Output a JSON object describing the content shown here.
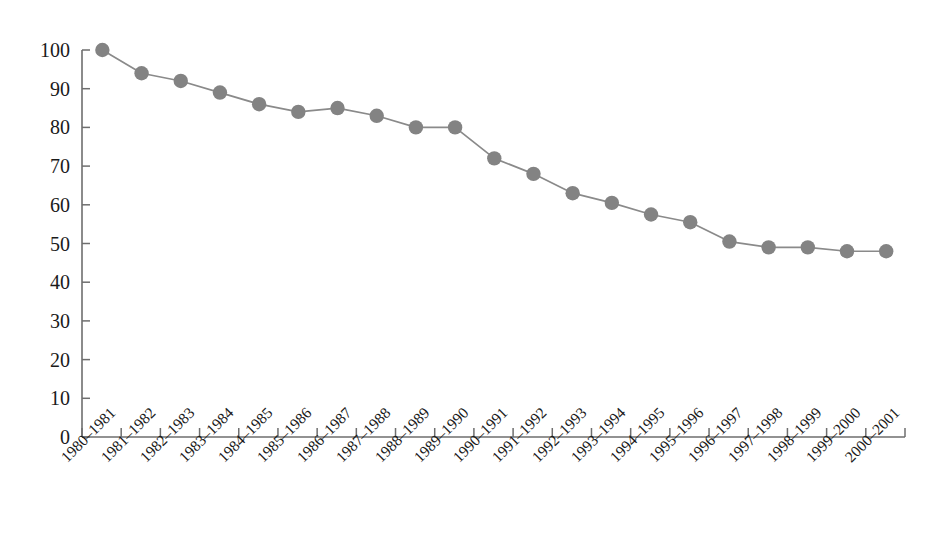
{
  "chart_data": {
    "type": "line",
    "title": "",
    "subtitle": "",
    "xlabel": "",
    "ylabel": "",
    "categories": [
      "1980–1981",
      "1981–1982",
      "1982–1983",
      "1983–1984",
      "1984–1985",
      "1985–1986",
      "1986–1987",
      "1987–1988",
      "1988–1989",
      "1989–1990",
      "1990–1991",
      "1991–1992",
      "1992–1993",
      "1993–1994",
      "1994–1995",
      "1995–1996",
      "1996–1997",
      "1997–1998",
      "1998–1999",
      "1999–2000",
      "2000–2001"
    ],
    "values": [
      100,
      94,
      92,
      89,
      86,
      84,
      85,
      83,
      80,
      80,
      72,
      68,
      63,
      60.5,
      57.5,
      55.5,
      50.5,
      49,
      49,
      48,
      48
    ],
    "ylim": [
      0,
      100
    ],
    "yticks": [
      0,
      10,
      20,
      30,
      40,
      50,
      60,
      70,
      80,
      90,
      100
    ],
    "ytick_labels": [
      "0",
      "10",
      "20",
      "30",
      "40",
      "50",
      "60",
      "70",
      "80",
      "90",
      "100"
    ],
    "grid": false,
    "legend": null,
    "legend_position": "none",
    "series": [
      {
        "name": "",
        "color": "#838383",
        "marker": "circle",
        "values": [
          100,
          94,
          92,
          89,
          86,
          84,
          85,
          83,
          80,
          80,
          72,
          68,
          63,
          60.5,
          57.5,
          55.5,
          50.5,
          49,
          49,
          48,
          48
        ]
      }
    ],
    "annotations": []
  },
  "colors": {
    "series": "#838383",
    "line": "#8a8a8a",
    "axis": "#6e6e6e",
    "text": "#1a1a1a",
    "background": "#ffffff"
  },
  "axis": {
    "y_axis_name": "y-axis",
    "x_axis_name": "x-axis"
  }
}
